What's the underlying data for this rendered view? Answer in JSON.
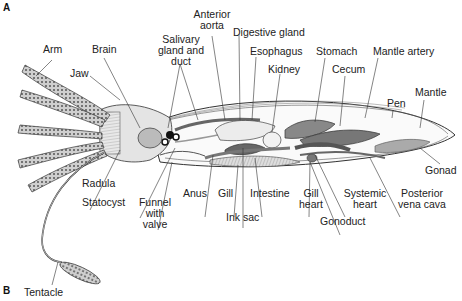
{
  "figure": {
    "panel_labels": [
      "A",
      "B"
    ],
    "labels": {
      "arm": "Arm",
      "brain": "Brain",
      "jaw": "Jaw",
      "salivary_1": "Salivary",
      "salivary_2": "gland and",
      "salivary_3": "duct",
      "anterior_aorta_1": "Anterior",
      "anterior_aorta_2": "aorta",
      "digestive_gland": "Digestive gland",
      "esophagus": "Esophagus",
      "kidney": "Kidney",
      "stomach": "Stomach",
      "cecum": "Cecum",
      "mantle_artery": "Mantle artery",
      "mantle": "Mantle",
      "pen": "Pen",
      "gonad": "Gonad",
      "radula": "Radula",
      "statocyst": "Statocyst",
      "funnel_1": "Funnel",
      "funnel_2": "with",
      "funnel_3": "valve",
      "anus": "Anus",
      "gill": "Gill",
      "intestine": "Intestine",
      "ink_sac": "Ink sac",
      "gill_heart_1": "Gill",
      "gill_heart_2": "heart",
      "systemic_heart_1": "Systemic",
      "systemic_heart_2": "heart",
      "gonoduct": "Gonoduct",
      "posterior_vena_cava_1": "Posterior",
      "posterior_vena_cava_2": "vena cava",
      "tentacle": "Tentacle"
    }
  }
}
